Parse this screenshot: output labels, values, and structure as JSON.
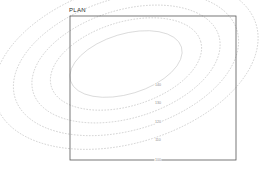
{
  "plan": {
    "title": "PLAN",
    "frame": {
      "x": 70,
      "y": 16,
      "width": 166,
      "height": 144,
      "stroke": "#565656",
      "stroke_width": 0.8
    }
  },
  "chart_data": {
    "type": "contour",
    "title": "PLAN",
    "xlabel": "",
    "ylabel": "",
    "grid": false,
    "legend": "none",
    "contour_color": "#b9b9b9",
    "inner_contour_color": "#c9c9c9",
    "label_color": "#8d8d8d",
    "line_style": "dashed",
    "center": {
      "x": 126,
      "y": 64
    },
    "rotation_deg": -17,
    "levels": [
      {
        "label": "140",
        "value": 140,
        "rx": 58,
        "ry": 30,
        "label_x": 158,
        "label_y": 85,
        "dashed": false
      },
      {
        "label": "130",
        "value": 130,
        "rx": 78,
        "ry": 42,
        "label_x": 158,
        "label_y": 103,
        "dashed": true
      },
      {
        "label": "120",
        "value": 120,
        "rx": 97,
        "ry": 54,
        "label_x": 158,
        "label_y": 122,
        "dashed": true
      },
      {
        "label": "110",
        "value": 110,
        "rx": 116,
        "ry": 66,
        "label_x": 158,
        "label_y": 140,
        "dashed": true
      },
      {
        "label": "100",
        "value": 100,
        "rx": 136,
        "ry": 79,
        "label_x": 158,
        "label_y": 160,
        "dashed": true
      }
    ]
  }
}
